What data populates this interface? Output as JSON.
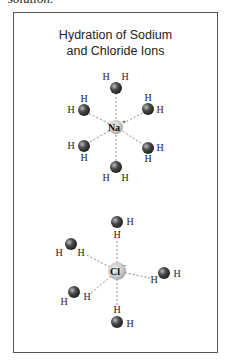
{
  "page": {
    "top_text": "solution."
  },
  "figure": {
    "title_line1": "Hydration of Sodium",
    "title_line2": "and Chloride Ions",
    "sodium": {
      "symbol": "Na",
      "charge": "+",
      "water_count": 6
    },
    "chloride": {
      "symbol": "Cl",
      "charge": "−",
      "water_count": 5
    },
    "atom_labels": {
      "oxygen": "O",
      "hydrogen": "H"
    },
    "colors": {
      "oxygen": "#3a3a3a",
      "ion": "#c8c8c8",
      "bond": "#888888",
      "frame": "#555555"
    }
  }
}
